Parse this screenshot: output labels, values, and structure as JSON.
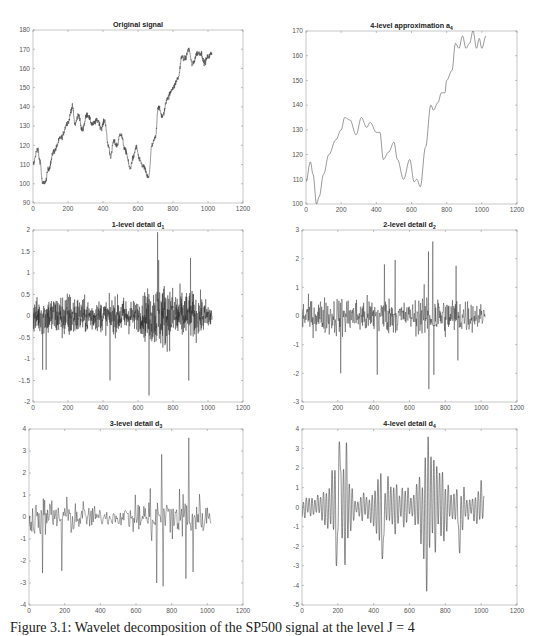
{
  "figure": {
    "caption": "Figure 3.1: Wavelet decomposition of the SP500 signal at the level J = 4"
  },
  "chart_data": [
    {
      "id": "original",
      "type": "line",
      "title": "Original signal",
      "title_sub": "",
      "xlabel": "",
      "ylabel": "",
      "xlim": [
        0,
        1200
      ],
      "ylim": [
        90,
        180
      ],
      "xticks": [
        0,
        200,
        400,
        600,
        800,
        1000,
        1200
      ],
      "yticks": [
        90,
        100,
        110,
        120,
        130,
        140,
        150,
        160,
        170,
        180
      ],
      "grid": false,
      "style": "noisy",
      "noise": 2.2,
      "keypoints": [
        [
          0,
          110
        ],
        [
          25,
          118
        ],
        [
          40,
          112
        ],
        [
          55,
          100
        ],
        [
          70,
          101
        ],
        [
          90,
          108
        ],
        [
          120,
          117
        ],
        [
          160,
          124
        ],
        [
          200,
          132
        ],
        [
          225,
          140
        ],
        [
          240,
          131
        ],
        [
          260,
          136
        ],
        [
          280,
          128
        ],
        [
          310,
          136
        ],
        [
          340,
          131
        ],
        [
          370,
          133
        ],
        [
          390,
          129
        ],
        [
          410,
          133
        ],
        [
          430,
          120
        ],
        [
          445,
          114
        ],
        [
          460,
          122
        ],
        [
          480,
          120
        ],
        [
          500,
          126
        ],
        [
          530,
          117
        ],
        [
          555,
          108
        ],
        [
          570,
          113
        ],
        [
          590,
          119
        ],
        [
          610,
          112
        ],
        [
          630,
          109
        ],
        [
          660,
          103
        ],
        [
          680,
          120
        ],
        [
          700,
          124
        ],
        [
          715,
          140
        ],
        [
          740,
          135
        ],
        [
          770,
          145
        ],
        [
          800,
          150
        ],
        [
          830,
          155
        ],
        [
          850,
          166
        ],
        [
          870,
          165
        ],
        [
          890,
          170
        ],
        [
          910,
          162
        ],
        [
          940,
          168
        ],
        [
          960,
          168
        ],
        [
          980,
          163
        ],
        [
          1000,
          166
        ],
        [
          1024,
          168
        ]
      ]
    },
    {
      "id": "approx_a4",
      "type": "line",
      "title": "4-level approximation a",
      "title_sub": "4",
      "xlabel": "",
      "ylabel": "",
      "xlim": [
        0,
        1200
      ],
      "ylim": [
        100,
        170
      ],
      "xticks": [
        0,
        200,
        400,
        600,
        800,
        1000,
        1200
      ],
      "yticks": [
        100,
        110,
        120,
        130,
        140,
        150,
        160,
        170
      ],
      "grid": false,
      "style": "smooth",
      "keypoints": [
        [
          0,
          109
        ],
        [
          25,
          117
        ],
        [
          40,
          112
        ],
        [
          60,
          100
        ],
        [
          75,
          103
        ],
        [
          100,
          112
        ],
        [
          130,
          120
        ],
        [
          170,
          126
        ],
        [
          200,
          130
        ],
        [
          220,
          135
        ],
        [
          250,
          134
        ],
        [
          285,
          128
        ],
        [
          315,
          135
        ],
        [
          345,
          131
        ],
        [
          365,
          133
        ],
        [
          400,
          129
        ],
        [
          420,
          129
        ],
        [
          440,
          118
        ],
        [
          470,
          121
        ],
        [
          500,
          125
        ],
        [
          520,
          118
        ],
        [
          555,
          110
        ],
        [
          590,
          118
        ],
        [
          615,
          109
        ],
        [
          630,
          110
        ],
        [
          650,
          107
        ],
        [
          680,
          123
        ],
        [
          710,
          140
        ],
        [
          725,
          138
        ],
        [
          750,
          141
        ],
        [
          770,
          145
        ],
        [
          790,
          145
        ],
        [
          800,
          150
        ],
        [
          830,
          154
        ],
        [
          850,
          165
        ],
        [
          870,
          163
        ],
        [
          890,
          168
        ],
        [
          910,
          163
        ],
        [
          930,
          165
        ],
        [
          950,
          170
        ],
        [
          970,
          163
        ],
        [
          985,
          167
        ],
        [
          1000,
          163
        ],
        [
          1024,
          168
        ]
      ]
    },
    {
      "id": "detail_d1",
      "type": "line",
      "title": "1-level detail d",
      "title_sub": "1",
      "xlabel": "",
      "ylabel": "",
      "xlim": [
        0,
        1200
      ],
      "ylim": [
        -2,
        2
      ],
      "xticks": [
        0,
        200,
        400,
        600,
        800,
        1000,
        1200
      ],
      "yticks": [
        -2,
        -1.5,
        -1,
        -0.5,
        0,
        0.5,
        1,
        1.5,
        2
      ],
      "grid": false,
      "style": "detail",
      "n": 1024,
      "step": 1,
      "amp_envelope": [
        [
          0,
          0.5
        ],
        [
          100,
          0.6
        ],
        [
          200,
          0.7
        ],
        [
          300,
          0.5
        ],
        [
          400,
          0.45
        ],
        [
          500,
          0.55
        ],
        [
          600,
          0.45
        ],
        [
          660,
          0.8
        ],
        [
          720,
          1.0
        ],
        [
          800,
          0.85
        ],
        [
          900,
          0.7
        ],
        [
          1024,
          0.4
        ]
      ],
      "spikes": [
        [
          663,
          -1.85
        ],
        [
          712,
          1.95
        ],
        [
          440,
          -1.5
        ],
        [
          890,
          -1.5
        ],
        [
          55,
          -1.25
        ],
        [
          75,
          -1.25
        ],
        [
          718,
          1.3
        ],
        [
          900,
          1.35
        ]
      ]
    },
    {
      "id": "detail_d2",
      "type": "line",
      "title": "2-level detail d",
      "title_sub": "2",
      "xlabel": "",
      "ylabel": "",
      "xlim": [
        0,
        1200
      ],
      "ylim": [
        -3,
        3
      ],
      "xticks": [
        0,
        200,
        400,
        600,
        800,
        1000,
        1200
      ],
      "yticks": [
        -3,
        -2,
        -1,
        0,
        1,
        2,
        3
      ],
      "grid": false,
      "style": "detail",
      "n": 512,
      "step": 2,
      "amp_envelope": [
        [
          0,
          0.7
        ],
        [
          200,
          0.9
        ],
        [
          300,
          0.8
        ],
        [
          400,
          0.9
        ],
        [
          500,
          0.8
        ],
        [
          600,
          0.6
        ],
        [
          700,
          1.1
        ],
        [
          800,
          0.9
        ],
        [
          900,
          0.8
        ],
        [
          1024,
          0.5
        ]
      ],
      "spikes": [
        [
          730,
          2.6
        ],
        [
          705,
          2.25
        ],
        [
          708,
          -2.55
        ],
        [
          520,
          1.95
        ],
        [
          420,
          -2.05
        ],
        [
          215,
          -2.0
        ],
        [
          735,
          -2.05
        ],
        [
          460,
          1.8
        ],
        [
          860,
          1.75
        ],
        [
          870,
          -1.55
        ]
      ]
    },
    {
      "id": "detail_d3",
      "type": "line",
      "title": "3-level detail d",
      "title_sub": "3",
      "xlabel": "",
      "ylabel": "",
      "xlim": [
        0,
        1200
      ],
      "ylim": [
        -4,
        4
      ],
      "xticks": [
        0,
        200,
        400,
        600,
        800,
        1000,
        1200
      ],
      "yticks": [
        -4,
        -3,
        -2,
        -1,
        0,
        1,
        2,
        3,
        4
      ],
      "grid": false,
      "style": "detail",
      "n": 256,
      "step": 4,
      "amp_envelope": [
        [
          0,
          1.0
        ],
        [
          100,
          1.2
        ],
        [
          200,
          1.1
        ],
        [
          300,
          0.9
        ],
        [
          400,
          0.5
        ],
        [
          500,
          0.5
        ],
        [
          600,
          1.0
        ],
        [
          700,
          1.5
        ],
        [
          800,
          1.5
        ],
        [
          900,
          1.8
        ],
        [
          1024,
          0.7
        ]
      ],
      "spikes": [
        [
          895,
          3.6
        ],
        [
          745,
          2.85
        ],
        [
          750,
          -3.15
        ],
        [
          715,
          -3.0
        ],
        [
          880,
          -2.8
        ],
        [
          75,
          -2.55
        ],
        [
          185,
          -2.45
        ],
        [
          920,
          -2.5
        ]
      ]
    },
    {
      "id": "detail_d4",
      "type": "line",
      "title": "4-level detail d",
      "title_sub": "4",
      "xlabel": "",
      "ylabel": "",
      "xlim": [
        0,
        1200
      ],
      "ylim": [
        -5,
        4
      ],
      "xticks": [
        0,
        200,
        400,
        600,
        800,
        1000,
        1200
      ],
      "yticks": [
        -5,
        -4,
        -3,
        -2,
        -1,
        0,
        1,
        2,
        3,
        4
      ],
      "grid": false,
      "style": "detail_smooth",
      "n": 128,
      "step": 8,
      "amp_envelope": [
        [
          0,
          0.6
        ],
        [
          100,
          0.7
        ],
        [
          180,
          2.5
        ],
        [
          250,
          2.8
        ],
        [
          300,
          0.7
        ],
        [
          380,
          0.8
        ],
        [
          420,
          1.8
        ],
        [
          500,
          1.8
        ],
        [
          560,
          1.3
        ],
        [
          620,
          0.8
        ],
        [
          680,
          2.8
        ],
        [
          720,
          3.0
        ],
        [
          780,
          2.0
        ],
        [
          840,
          0.9
        ],
        [
          900,
          1.2
        ],
        [
          950,
          0.6
        ],
        [
          980,
          1.8
        ],
        [
          1024,
          1.5
        ]
      ],
      "spikes": [
        [
          700,
          3.6
        ],
        [
          698,
          -4.3
        ],
        [
          205,
          3.35
        ],
        [
          250,
          3.3
        ],
        [
          190,
          -3.0
        ],
        [
          240,
          -2.95
        ],
        [
          450,
          -2.65
        ],
        [
          880,
          -2.35
        ]
      ]
    }
  ]
}
